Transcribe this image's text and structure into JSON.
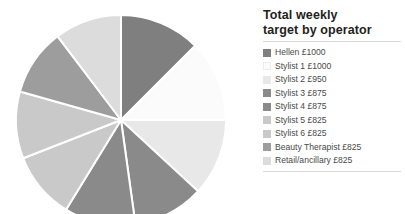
{
  "legend": {
    "title_line1": "Total weekly",
    "title_line2": "target by operator"
  },
  "chart_data": {
    "type": "pie",
    "title": "Total weekly target by operator",
    "unit": "£",
    "start_angle_deg": 0,
    "direction": "clockwise",
    "total": 7925,
    "categories": [
      "Hellen £1000",
      "Stylist 1 £1000",
      "Stylist 2 £950",
      "Stylist 3 £875",
      "Stylist 4 £875",
      "Stylist 5 £825",
      "Stylist 6 £825",
      "Beauty Therapist £825",
      "Retail/ancillary £825"
    ],
    "names": [
      "Hellen",
      "Stylist 1",
      "Stylist 2",
      "Stylist 3",
      "Stylist 4",
      "Stylist 5",
      "Stylist 6",
      "Beauty Therapist",
      "Retail/ancillary"
    ],
    "values": [
      1000,
      1000,
      950,
      875,
      875,
      825,
      825,
      825,
      825
    ],
    "colors": [
      "#7f7f7f",
      "#fbfbfb",
      "#e8e8e8",
      "#8a8a8a",
      "#8a8a8a",
      "#c9c9c9",
      "#c9c9c9",
      "#9d9d9d",
      "#dcdcdc"
    ],
    "slice_border_color": "#ffffff",
    "legend_position": "right"
  }
}
